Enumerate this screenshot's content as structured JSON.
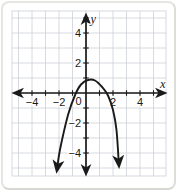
{
  "figure": {
    "origin_label": "0"
  },
  "colors": {
    "background": "#ffffff",
    "frame": "#e6e5e1",
    "grid": "#cdd0d7",
    "axis": "#1a1a1a",
    "curve": "#1a1a1a",
    "label": "#1a1a1a"
  },
  "chart_data": {
    "type": "line",
    "title": "",
    "xlabel": "x",
    "ylabel": "y",
    "xlim": [
      -5.5,
      5.5
    ],
    "ylim": [
      -5.5,
      5.5
    ],
    "grid": true,
    "minor_tick_step": 1,
    "origin_label": "0",
    "x_ticks_labeled": [
      {
        "value": -4,
        "label": "−4"
      },
      {
        "value": -2,
        "label": "−2"
      },
      {
        "value": 2,
        "label": "2"
      },
      {
        "value": 4,
        "label": "4"
      }
    ],
    "y_ticks_labeled": [
      {
        "value": 4,
        "label": "4"
      },
      {
        "value": 2,
        "label": "2"
      },
      {
        "value": -2,
        "label": "−2"
      },
      {
        "value": -4,
        "label": "−4"
      }
    ],
    "series": [
      {
        "name": "parabola",
        "shape": "downward-opening parabola with arrowheads on both ends",
        "vertex_approx": [
          0.3,
          0.9
        ],
        "x_intercepts_approx": [
          -0.9,
          1.6
        ],
        "points": [
          [
            -2.15,
            -5.13
          ],
          [
            -1.93,
            -3.8
          ],
          [
            -1.33,
            -1.47
          ],
          [
            -0.81,
            -0.13
          ],
          [
            -0.37,
            0.57
          ],
          [
            0.15,
            0.87
          ],
          [
            0.67,
            0.83
          ],
          [
            1.19,
            0.4
          ],
          [
            1.63,
            -0.17
          ],
          [
            2.0,
            -1.13
          ],
          [
            2.26,
            -2.47
          ],
          [
            2.44,
            -4.8
          ]
        ]
      }
    ]
  }
}
